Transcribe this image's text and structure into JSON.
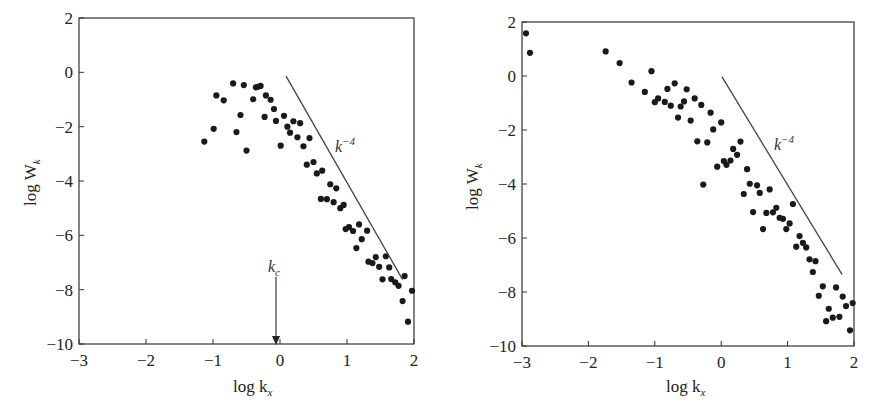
{
  "chart_data": [
    {
      "type": "scatter",
      "title": "",
      "xlabel": "log k_x",
      "ylabel": "log W_k",
      "xlim": [
        -3,
        2
      ],
      "ylim": [
        -10,
        2
      ],
      "xticks": [
        -3,
        -2,
        -1,
        0,
        1,
        2
      ],
      "yticks": [
        2,
        0,
        -2,
        -4,
        -6,
        -8,
        -10
      ],
      "grid": false,
      "legend": null,
      "reference_line": {
        "label": "k^-4",
        "from": [
          0.09,
          -0.14
        ],
        "to": [
          1.83,
          -7.63
        ]
      },
      "annotations": [
        {
          "text": "k_c",
          "type": "arrow",
          "x": 0.0,
          "y_from": -7.5,
          "y_to": -10
        }
      ],
      "points": [
        [
          -1.13,
          -2.55
        ],
        [
          -0.99,
          -2.08
        ],
        [
          -0.95,
          -0.85
        ],
        [
          -0.84,
          -1.03
        ],
        [
          -0.7,
          -0.41
        ],
        [
          -0.65,
          -2.2
        ],
        [
          -0.59,
          -1.57
        ],
        [
          -0.54,
          -0.47
        ],
        [
          -0.5,
          -2.88
        ],
        [
          -0.4,
          -0.99
        ],
        [
          -0.36,
          -0.55
        ],
        [
          -0.33,
          -0.53
        ],
        [
          -0.29,
          -0.5
        ],
        [
          -0.23,
          -1.64
        ],
        [
          -0.21,
          -0.85
        ],
        [
          -0.14,
          -1.01
        ],
        [
          -0.09,
          -1.35
        ],
        [
          -0.06,
          -1.79
        ],
        [
          0.01,
          -2.7
        ],
        [
          0.06,
          -1.6
        ],
        [
          0.11,
          -2.0
        ],
        [
          0.15,
          -2.22
        ],
        [
          0.2,
          -1.8
        ],
        [
          0.26,
          -2.39
        ],
        [
          0.3,
          -1.87
        ],
        [
          0.35,
          -2.72
        ],
        [
          0.44,
          -2.42
        ],
        [
          0.4,
          -3.4
        ],
        [
          0.5,
          -3.3
        ],
        [
          0.55,
          -3.72
        ],
        [
          0.63,
          -3.62
        ],
        [
          0.61,
          -4.66
        ],
        [
          0.7,
          -4.67
        ],
        [
          0.75,
          -4.12
        ],
        [
          0.8,
          -4.78
        ],
        [
          0.84,
          -4.27
        ],
        [
          0.9,
          -5.0
        ],
        [
          0.95,
          -4.88
        ],
        [
          0.98,
          -5.77
        ],
        [
          1.03,
          -5.7
        ],
        [
          1.09,
          -5.84
        ],
        [
          1.18,
          -5.6
        ],
        [
          1.14,
          -6.47
        ],
        [
          1.22,
          -6.14
        ],
        [
          1.3,
          -5.83
        ],
        [
          1.32,
          -6.97
        ],
        [
          1.38,
          -7.02
        ],
        [
          1.43,
          -6.8
        ],
        [
          1.48,
          -7.16
        ],
        [
          1.53,
          -7.62
        ],
        [
          1.58,
          -6.77
        ],
        [
          1.63,
          -7.18
        ],
        [
          1.66,
          -7.61
        ],
        [
          1.72,
          -7.73
        ],
        [
          1.77,
          -7.86
        ],
        [
          1.83,
          -8.42
        ],
        [
          1.86,
          -7.5
        ],
        [
          1.91,
          -9.18
        ],
        [
          1.97,
          -8.04
        ]
      ]
    },
    {
      "type": "scatter",
      "title": "",
      "xlabel": "log k_x",
      "ylabel": "log W_k",
      "xlim": [
        -3,
        2
      ],
      "ylim": [
        -10,
        2
      ],
      "xticks": [
        -3,
        -2,
        -1,
        0,
        1,
        2
      ],
      "yticks": [
        2,
        0,
        -2,
        -4,
        -6,
        -8,
        -10
      ],
      "grid": false,
      "legend": null,
      "reference_line": {
        "label": "k^-4",
        "from": [
          0.01,
          -0.02
        ],
        "to": [
          1.82,
          -7.35
        ]
      },
      "annotations": [],
      "points": [
        [
          -2.94,
          1.58
        ],
        [
          -2.88,
          0.86
        ],
        [
          -1.74,
          0.91
        ],
        [
          -1.53,
          0.48
        ],
        [
          -1.35,
          -0.24
        ],
        [
          -1.15,
          -0.59
        ],
        [
          -1.05,
          0.18
        ],
        [
          -1.0,
          -0.97
        ],
        [
          -0.95,
          -0.83
        ],
        [
          -0.85,
          -0.96
        ],
        [
          -0.81,
          -0.48
        ],
        [
          -0.76,
          -1.1
        ],
        [
          -0.7,
          -0.27
        ],
        [
          -0.65,
          -1.54
        ],
        [
          -0.61,
          -1.13
        ],
        [
          -0.56,
          -0.94
        ],
        [
          -0.52,
          -0.49
        ],
        [
          -0.46,
          -1.65
        ],
        [
          -0.4,
          -0.83
        ],
        [
          -0.36,
          -2.42
        ],
        [
          -0.3,
          -1.07
        ],
        [
          -0.27,
          -4.02
        ],
        [
          -0.21,
          -2.46
        ],
        [
          -0.16,
          -1.36
        ],
        [
          -0.12,
          -1.98
        ],
        [
          -0.06,
          -3.36
        ],
        [
          0.0,
          -1.72
        ],
        [
          0.04,
          -3.15
        ],
        [
          0.08,
          -3.29
        ],
        [
          0.14,
          -3.13
        ],
        [
          0.18,
          -2.7
        ],
        [
          0.24,
          -2.92
        ],
        [
          0.29,
          -2.43
        ],
        [
          0.34,
          -4.37
        ],
        [
          0.39,
          -3.45
        ],
        [
          0.43,
          -3.99
        ],
        [
          0.48,
          -5.04
        ],
        [
          0.54,
          -4.05
        ],
        [
          0.58,
          -4.33
        ],
        [
          0.63,
          -5.67
        ],
        [
          0.68,
          -5.07
        ],
        [
          0.73,
          -4.2
        ],
        [
          0.78,
          -5.05
        ],
        [
          0.83,
          -4.88
        ],
        [
          0.88,
          -5.25
        ],
        [
          0.93,
          -5.29
        ],
        [
          0.98,
          -5.67
        ],
        [
          1.03,
          -5.46
        ],
        [
          1.08,
          -4.74
        ],
        [
          1.13,
          -6.32
        ],
        [
          1.18,
          -5.93
        ],
        [
          1.23,
          -6.18
        ],
        [
          1.28,
          -6.35
        ],
        [
          1.33,
          -6.79
        ],
        [
          1.38,
          -7.26
        ],
        [
          1.42,
          -6.86
        ],
        [
          1.47,
          -8.14
        ],
        [
          1.53,
          -7.79
        ],
        [
          1.58,
          -9.08
        ],
        [
          1.62,
          -8.62
        ],
        [
          1.68,
          -8.95
        ],
        [
          1.73,
          -7.83
        ],
        [
          1.78,
          -8.92
        ],
        [
          1.83,
          -8.17
        ],
        [
          1.88,
          -8.52
        ],
        [
          1.94,
          -9.42
        ],
        [
          1.98,
          -8.41
        ]
      ]
    }
  ],
  "panels": [
    {
      "ylabel_main": "log W",
      "ylabel_sub": "k",
      "xlabel_main": "log k",
      "xlabel_sub": "x",
      "line_label_base": "k",
      "line_label_exp": "−4",
      "kc_label_base": "k",
      "kc_label_sub": "c",
      "xtick_labels": [
        "−3",
        "−2",
        "−1",
        "0",
        "1",
        "2"
      ],
      "ytick_labels": [
        "2",
        "0",
        "−2",
        "−4",
        "−6",
        "−8",
        "−10"
      ]
    },
    {
      "ylabel_main": "log W",
      "ylabel_sub": "k",
      "xlabel_main": "log k",
      "xlabel_sub": "x",
      "line_label_base": "k",
      "line_label_exp": "−4",
      "xtick_labels": [
        "−3",
        "−2",
        "−1",
        "0",
        "1",
        "2"
      ],
      "ytick_labels": [
        "2",
        "0",
        "−2",
        "−4",
        "−6",
        "−8",
        "−10"
      ]
    }
  ],
  "colors": {
    "ink": "#222222",
    "line": "#444444",
    "background": "#ffffff"
  }
}
